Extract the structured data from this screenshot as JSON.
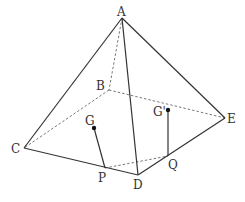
{
  "diagram": {
    "labels": {
      "A": "A",
      "B": "B",
      "C": "C",
      "D": "D",
      "E": "E",
      "G": "G",
      "Gp": "G'",
      "P": "P",
      "Q": "Q"
    },
    "points": {
      "A": [
        122,
        18
      ],
      "B": [
        109,
        90
      ],
      "C": [
        24,
        148
      ],
      "D": [
        138,
        175
      ],
      "E": [
        225,
        118
      ],
      "P": [
        105,
        168
      ],
      "Q": [
        168,
        156
      ],
      "G": [
        94,
        128
      ],
      "Gp": [
        168,
        110
      ]
    },
    "solid_edges": [
      [
        "A",
        "C"
      ],
      [
        "A",
        "D"
      ],
      [
        "A",
        "E"
      ],
      [
        "C",
        "D"
      ],
      [
        "D",
        "E"
      ],
      [
        "G",
        "P"
      ],
      [
        "Gp",
        "Q"
      ]
    ],
    "hidden_edges": [
      [
        "A",
        "B"
      ],
      [
        "B",
        "C"
      ],
      [
        "B",
        "E"
      ],
      [
        "P",
        "Q"
      ]
    ],
    "colors": {
      "line": "#333333",
      "dashed": "#555555",
      "point": "#111111"
    }
  }
}
